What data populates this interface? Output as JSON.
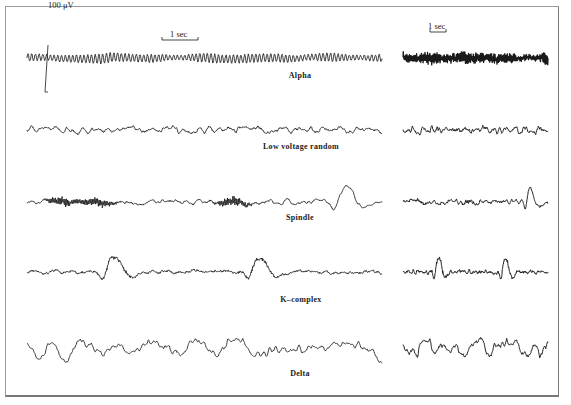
{
  "figure": {
    "scale_bars": {
      "time_left": {
        "label": "1 sec",
        "x1": 162,
        "x2": 198,
        "y": 40
      },
      "time_right": {
        "label": "1 sec",
        "x1": 430,
        "x2": 446,
        "y": 32
      },
      "voltage": {
        "label": "100 μV",
        "x": 45,
        "y1": 75,
        "y2": 92
      }
    },
    "rows": [
      {
        "name": "alpha",
        "label": "Alpha",
        "label_x": 300,
        "label_y": 71,
        "y": 58
      },
      {
        "name": "low-voltage-random",
        "label": "Low voltage random",
        "label_x": 301,
        "label_y": 142,
        "y": 130
      },
      {
        "name": "spindle",
        "label": "Spindle",
        "label_x": 300,
        "label_y": 213,
        "y": 202
      },
      {
        "name": "k-complex",
        "label": "K–complex",
        "label_x": 301,
        "label_y": 295,
        "y": 272
      },
      {
        "name": "delta",
        "label": "Delta",
        "label_x": 300,
        "label_y": 369,
        "y": 350
      }
    ],
    "traces": {
      "left": {
        "x1": 27,
        "x2": 382
      },
      "right": {
        "x1": 403,
        "x2": 548
      }
    },
    "colors": {
      "ink": "#1a1a1a",
      "frame": "#8a8a8a",
      "background": "#ffffff"
    }
  }
}
